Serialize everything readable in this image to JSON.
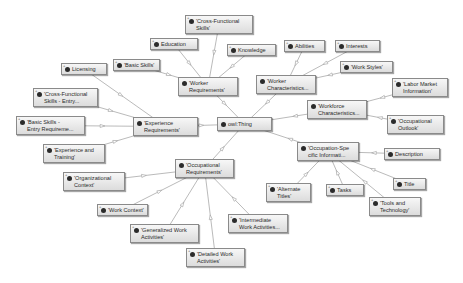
{
  "diagram": {
    "type": "ontology-graph",
    "root": "owl:Thing",
    "nodes": [
      {
        "id": "thing",
        "lines": [
          "owl:Thing"
        ],
        "x": 217,
        "y": 117,
        "w": 55,
        "h": 14,
        "expandable": false
      },
      {
        "id": "cfs",
        "lines": [
          "'Cross-Functional",
          "Skills'"
        ],
        "x": 185,
        "y": 15,
        "w": 68,
        "h": 19,
        "expandable": true
      },
      {
        "id": "education",
        "lines": [
          "Education"
        ],
        "x": 150,
        "y": 38,
        "w": 48,
        "h": 12,
        "expandable": true
      },
      {
        "id": "knowledge",
        "lines": [
          "Knowledge"
        ],
        "x": 227,
        "y": 44,
        "w": 49,
        "h": 12,
        "expandable": true
      },
      {
        "id": "basic",
        "lines": [
          "'Basic Skills'"
        ],
        "x": 113,
        "y": 59,
        "w": 47,
        "h": 12,
        "expandable": true
      },
      {
        "id": "licensing",
        "lines": [
          "Licensing"
        ],
        "x": 61,
        "y": 63,
        "w": 46,
        "h": 12,
        "expandable": true
      },
      {
        "id": "workerreq",
        "lines": [
          "'Worker",
          "Requirements'"
        ],
        "x": 178,
        "y": 77,
        "w": 60,
        "h": 19,
        "expandable": false
      },
      {
        "id": "abilities",
        "lines": [
          "Abilities"
        ],
        "x": 284,
        "y": 40,
        "w": 41,
        "h": 12,
        "expandable": true
      },
      {
        "id": "interests",
        "lines": [
          "Interests"
        ],
        "x": 335,
        "y": 40,
        "w": 45,
        "h": 12,
        "expandable": true
      },
      {
        "id": "workstyles",
        "lines": [
          "'Work Styles'"
        ],
        "x": 340,
        "y": 61,
        "w": 53,
        "h": 12,
        "expandable": true
      },
      {
        "id": "workerchar",
        "lines": [
          "'Worker",
          "Characteristics..."
        ],
        "x": 256,
        "y": 75,
        "w": 60,
        "h": 19,
        "expandable": false
      },
      {
        "id": "labor",
        "lines": [
          "'Labor Market",
          "Information'"
        ],
        "x": 392,
        "y": 78,
        "w": 56,
        "h": 19,
        "expandable": true
      },
      {
        "id": "workforce",
        "lines": [
          "'Workforce",
          "Characteristics..."
        ],
        "x": 307,
        "y": 100,
        "w": 60,
        "h": 19,
        "expandable": false
      },
      {
        "id": "outlook",
        "lines": [
          "'Occupational",
          "Outlook'"
        ],
        "x": 387,
        "y": 115,
        "w": 57,
        "h": 19,
        "expandable": true
      },
      {
        "id": "cfsentry",
        "lines": [
          "'Cross-Functional",
          "Skills - Entry..."
        ],
        "x": 33,
        "y": 88,
        "w": 65,
        "h": 19,
        "expandable": true
      },
      {
        "id": "basicentry",
        "lines": [
          "'Basic Skills -",
          "Entry Requireme..."
        ],
        "x": 16,
        "y": 116,
        "w": 69,
        "h": 19,
        "expandable": true
      },
      {
        "id": "expreq",
        "lines": [
          "'Experience",
          "Requirements'"
        ],
        "x": 133,
        "y": 117,
        "w": 65,
        "h": 19,
        "expandable": false
      },
      {
        "id": "exptrain",
        "lines": [
          "'Experience and",
          "Training'"
        ],
        "x": 43,
        "y": 144,
        "w": 62,
        "h": 19,
        "expandable": true
      },
      {
        "id": "occspec",
        "lines": [
          "'Occupation-Spe",
          "cific Informati..."
        ],
        "x": 297,
        "y": 142,
        "w": 62,
        "h": 19,
        "expandable": false
      },
      {
        "id": "description",
        "lines": [
          "Description"
        ],
        "x": 384,
        "y": 148,
        "w": 56,
        "h": 12,
        "expandable": true
      },
      {
        "id": "occreq",
        "lines": [
          "'Occupational",
          "Requirements'"
        ],
        "x": 175,
        "y": 159,
        "w": 59,
        "h": 19,
        "expandable": false
      },
      {
        "id": "orgctx",
        "lines": [
          "'Organizational",
          "Context'"
        ],
        "x": 63,
        "y": 172,
        "w": 62,
        "h": 19,
        "expandable": true
      },
      {
        "id": "title",
        "lines": [
          "Title"
        ],
        "x": 393,
        "y": 178,
        "w": 33,
        "h": 12,
        "expandable": true
      },
      {
        "id": "alttitles",
        "lines": [
          "'Alternate",
          "Titles'"
        ],
        "x": 266,
        "y": 183,
        "w": 45,
        "h": 19,
        "expandable": true
      },
      {
        "id": "tasks",
        "lines": [
          "Tasks"
        ],
        "x": 326,
        "y": 184,
        "w": 38,
        "h": 12,
        "expandable": true
      },
      {
        "id": "tools",
        "lines": [
          "'Tools and",
          "Technology'"
        ],
        "x": 369,
        "y": 197,
        "w": 52,
        "h": 19,
        "expandable": true
      },
      {
        "id": "workctx",
        "lines": [
          "'Work Context'"
        ],
        "x": 97,
        "y": 204,
        "w": 51,
        "h": 12,
        "expandable": true
      },
      {
        "id": "gwa",
        "lines": [
          "'Generalized Work",
          "Activities'"
        ],
        "x": 130,
        "y": 224,
        "w": 69,
        "h": 19,
        "expandable": true
      },
      {
        "id": "iwa",
        "lines": [
          "'Intermediate",
          "Work Activities..."
        ],
        "x": 228,
        "y": 214,
        "w": 60,
        "h": 19,
        "expandable": true
      },
      {
        "id": "dwa",
        "lines": [
          "'Detailed Work",
          "Activities'"
        ],
        "x": 186,
        "y": 248,
        "w": 59,
        "h": 19,
        "expandable": true
      }
    ],
    "edges": [
      [
        "thing",
        "workerreq"
      ],
      [
        "thing",
        "workerchar"
      ],
      [
        "thing",
        "workforce"
      ],
      [
        "thing",
        "expreq"
      ],
      [
        "thing",
        "occspec"
      ],
      [
        "thing",
        "occreq"
      ],
      [
        "workerreq",
        "cfs"
      ],
      [
        "workerreq",
        "education"
      ],
      [
        "workerreq",
        "knowledge"
      ],
      [
        "workerreq",
        "basic"
      ],
      [
        "workerchar",
        "abilities"
      ],
      [
        "workerchar",
        "interests"
      ],
      [
        "workerchar",
        "workstyles"
      ],
      [
        "workforce",
        "labor"
      ],
      [
        "workforce",
        "outlook"
      ],
      [
        "expreq",
        "licensing"
      ],
      [
        "expreq",
        "cfsentry"
      ],
      [
        "expreq",
        "basicentry"
      ],
      [
        "expreq",
        "exptrain"
      ],
      [
        "occspec",
        "description"
      ],
      [
        "occspec",
        "title"
      ],
      [
        "occspec",
        "alttitles"
      ],
      [
        "occspec",
        "tasks"
      ],
      [
        "occspec",
        "tools"
      ],
      [
        "occreq",
        "orgctx"
      ],
      [
        "occreq",
        "workctx"
      ],
      [
        "occreq",
        "gwa"
      ],
      [
        "occreq",
        "iwa"
      ],
      [
        "occreq",
        "dwa"
      ]
    ],
    "colors": {
      "edge": "#a8a8a8",
      "node_border": "#8a8a8a",
      "node_fill_top": "#f7f7f7",
      "node_fill_bottom": "#dcdcdc",
      "dot": "#2b2b2b",
      "text": "#2a2a2a"
    }
  }
}
